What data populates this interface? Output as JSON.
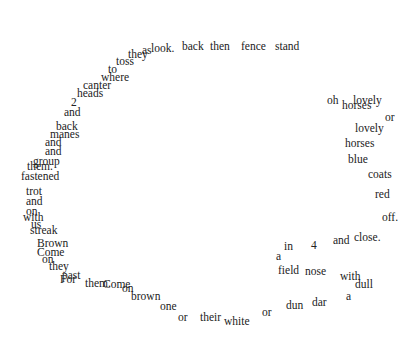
{
  "poem": {
    "text_color": "#222222",
    "background": "#ffffff",
    "words": [
      {
        "t": "they",
        "x": 128,
        "y": 58
      },
      {
        "t": "as",
        "x": 142,
        "y": 54
      },
      {
        "t": "look.",
        "x": 151,
        "y": 52
      },
      {
        "t": "back",
        "x": 182,
        "y": 50
      },
      {
        "t": "then",
        "x": 210,
        "y": 50
      },
      {
        "t": "fence",
        "x": 241,
        "y": 50
      },
      {
        "t": "stand",
        "x": 275,
        "y": 50
      },
      {
        "t": "toss",
        "x": 116,
        "y": 65
      },
      {
        "t": "to",
        "x": 108,
        "y": 73
      },
      {
        "t": "where",
        "x": 101,
        "y": 81
      },
      {
        "t": "canter",
        "x": 83,
        "y": 89
      },
      {
        "t": "heads",
        "x": 77,
        "y": 97
      },
      {
        "t": "2",
        "x": 71,
        "y": 106
      },
      {
        "t": "and",
        "x": 64,
        "y": 116
      },
      {
        "t": "back",
        "x": 56,
        "y": 130
      },
      {
        "t": "manes",
        "x": 50,
        "y": 138
      },
      {
        "t": "and",
        "x": 45,
        "y": 146
      },
      {
        "t": "and",
        "x": 45,
        "y": 155
      },
      {
        "t": "group",
        "x": 33,
        "y": 165
      },
      {
        "t": "them.",
        "x": 27,
        "y": 170
      },
      {
        "t": "fastened",
        "x": 21,
        "y": 180
      },
      {
        "t": "trot",
        "x": 26,
        "y": 195
      },
      {
        "t": "and",
        "x": 26,
        "y": 205
      },
      {
        "t": "on",
        "x": 26,
        "y": 215
      },
      {
        "t": "with",
        "x": 23,
        "y": 221
      },
      {
        "t": "us",
        "x": 31,
        "y": 228
      },
      {
        "t": "streak",
        "x": 30,
        "y": 234
      },
      {
        "t": "Brown",
        "x": 37,
        "y": 247
      },
      {
        "t": "Come",
        "x": 37,
        "y": 256
      },
      {
        "t": "on",
        "x": 42,
        "y": 263
      },
      {
        "t": "they",
        "x": 49,
        "y": 270
      },
      {
        "t": "past",
        "x": 62,
        "y": 279
      },
      {
        "t": "For",
        "x": 60,
        "y": 283
      },
      {
        "t": "them.",
        "x": 85,
        "y": 287
      },
      {
        "t": "Come",
        "x": 103,
        "y": 288
      },
      {
        "t": "on",
        "x": 122,
        "y": 292
      },
      {
        "t": "brown",
        "x": 131,
        "y": 300
      },
      {
        "t": "one",
        "x": 160,
        "y": 310
      },
      {
        "t": "or",
        "x": 178,
        "y": 321
      },
      {
        "t": "their",
        "x": 200,
        "y": 321
      },
      {
        "t": "white",
        "x": 224,
        "y": 325
      },
      {
        "t": "or",
        "x": 262,
        "y": 316
      },
      {
        "t": "dun",
        "x": 286,
        "y": 309
      },
      {
        "t": "dar",
        "x": 312,
        "y": 306
      },
      {
        "t": "a",
        "x": 346,
        "y": 300
      },
      {
        "t": "dull",
        "x": 355,
        "y": 288
      },
      {
        "t": "with",
        "x": 340,
        "y": 280
      },
      {
        "t": "nose",
        "x": 305,
        "y": 275
      },
      {
        "t": "field",
        "x": 278,
        "y": 274
      },
      {
        "t": "a",
        "x": 276,
        "y": 260
      },
      {
        "t": "in",
        "x": 284,
        "y": 250
      },
      {
        "t": "4",
        "x": 311,
        "y": 249
      },
      {
        "t": "and",
        "x": 333,
        "y": 244
      },
      {
        "t": "close.",
        "x": 354,
        "y": 241
      },
      {
        "t": "off.",
        "x": 382,
        "y": 221
      },
      {
        "t": "red",
        "x": 375,
        "y": 198
      },
      {
        "t": "coats",
        "x": 368,
        "y": 178
      },
      {
        "t": "blue",
        "x": 348,
        "y": 163
      },
      {
        "t": "horses",
        "x": 345,
        "y": 147
      },
      {
        "t": "lovely",
        "x": 355,
        "y": 132
      },
      {
        "t": "or",
        "x": 385,
        "y": 121
      },
      {
        "t": "lovely",
        "x": 353,
        "y": 104
      },
      {
        "t": "horses",
        "x": 342,
        "y": 109
      },
      {
        "t": "oh",
        "x": 327,
        "y": 104
      }
    ]
  }
}
